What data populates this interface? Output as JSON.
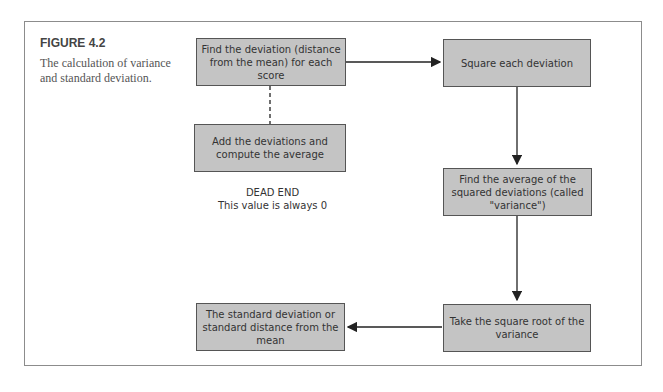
{
  "figure": {
    "label": "FIGURE 4.2",
    "caption": "The calculation of variance and standard deviation."
  },
  "nodes": {
    "find_deviation": "Find the deviation (distance from the mean) for each score",
    "add_deviations": "Add the deviations and compute the average",
    "dead_end_title": "DEAD END",
    "dead_end_text": "This value is always 0",
    "square_each": "Square each deviation",
    "average_squared": "Find the average of the squared deviations (called \"variance\")",
    "square_root": "Take the square root of the variance",
    "standard_deviation": "The standard deviation or standard distance from the mean"
  },
  "edges": [
    {
      "from": "find_deviation",
      "to": "square_each",
      "style": "solid-arrow"
    },
    {
      "from": "find_deviation",
      "to": "add_deviations",
      "style": "dashed"
    },
    {
      "from": "square_each",
      "to": "average_squared",
      "style": "solid-arrow"
    },
    {
      "from": "average_squared",
      "to": "square_root",
      "style": "solid-arrow"
    },
    {
      "from": "square_root",
      "to": "standard_deviation",
      "style": "solid-arrow"
    }
  ],
  "colors": {
    "box_fill": "#c4c4c4",
    "box_border": "#555555",
    "frame_border": "#8c8c8c"
  }
}
